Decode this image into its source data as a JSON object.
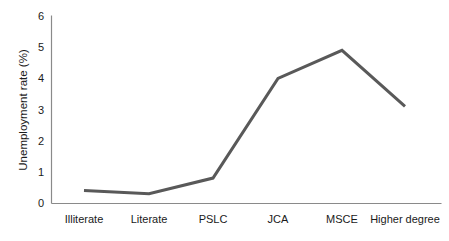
{
  "chart_data": {
    "type": "line",
    "title": "",
    "subtitle": "",
    "xlabel": "",
    "ylabel": "Unemployment rate (%)",
    "categories": [
      "Illiterate",
      "Literate",
      "PSLC",
      "JCA",
      "MSCE",
      "Higher degree"
    ],
    "values": [
      0.4,
      0.3,
      0.8,
      4.0,
      4.9,
      3.1
    ],
    "series": [
      {
        "name": "Unemployment rate",
        "values": [
          0.4,
          0.3,
          0.8,
          4.0,
          4.9,
          3.1
        ]
      }
    ],
    "ylim": [
      0,
      6
    ],
    "yticks": [
      "0",
      "1",
      "2",
      "3",
      "4",
      "5",
      "6"
    ],
    "ytick_values": [
      0,
      1,
      2,
      3,
      4,
      5,
      6
    ],
    "grid": false,
    "legend": "none",
    "line_color": "#595959",
    "axis_color": "#8a8a8a",
    "background_color": "#ffffff",
    "line_width": 3
  },
  "axis": {
    "y_title": "Unemployment rate (%)",
    "tick_0": "0",
    "tick_1": "1",
    "tick_2": "2",
    "tick_3": "3",
    "tick_4": "4",
    "tick_5": "5",
    "tick_6": "6"
  },
  "categories": {
    "c0": "Illiterate",
    "c1": "Literate",
    "c2": "PSLC",
    "c3": "JCA",
    "c4": "MSCE",
    "c5": "Higher degree"
  }
}
